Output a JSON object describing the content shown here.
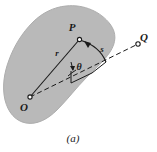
{
  "figure": {
    "caption": "(a)",
    "background_color": "#ffffff",
    "region_fill": "#b9b9b9",
    "region_stroke": "#a8a8a8",
    "line_color": "#1a1a1a",
    "labels": {
      "origin": "O",
      "point_p": "P",
      "point_q": "Q",
      "radius": "r",
      "arc": "s",
      "angle": "θ"
    },
    "geometry": {
      "origin_xy": [
        29,
        98
      ],
      "point_p_xy": [
        79,
        39
      ],
      "arc_end_xy": [
        105,
        62
      ],
      "point_q_xy": [
        138,
        43
      ],
      "angle_vertex_xy": [
        29,
        98
      ]
    }
  }
}
